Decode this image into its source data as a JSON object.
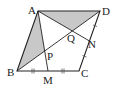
{
  "diagram": {
    "type": "parallelogram-geometry",
    "colors": {
      "stroke": "#222222",
      "shade": "#c8c8c8",
      "background": "#ffffff"
    },
    "points": {
      "A": {
        "label": "A",
        "x": 38,
        "y": 11
      },
      "D": {
        "label": "D",
        "x": 100,
        "y": 11
      },
      "B": {
        "label": "B",
        "x": 17,
        "y": 71
      },
      "C": {
        "label": "C",
        "x": 79,
        "y": 71
      },
      "M": {
        "label": "M",
        "x": 48,
        "y": 71
      },
      "N": {
        "label": "N",
        "x": 89.5,
        "y": 41
      },
      "P": {
        "label": "P",
        "x": 44.67,
        "y": 51
      },
      "Q": {
        "label": "Q",
        "x": 72.33,
        "y": 31
      }
    },
    "shaded_regions": [
      "triangle ABP",
      "triangle AQD"
    ],
    "segments": [
      "AB",
      "BC",
      "CD",
      "DA",
      "BD",
      "AM",
      "AN"
    ],
    "equal_marks": [
      "BM = MC",
      "CN = ND"
    ]
  }
}
